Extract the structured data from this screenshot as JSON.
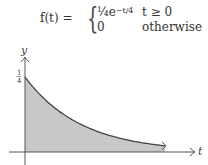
{
  "formula": {
    "lhs": "f(t) =",
    "cases": [
      {
        "expr_base": "¼e",
        "expr_exponent": "−t/4",
        "condition": "t ≥ 0"
      },
      {
        "expr": "0",
        "condition": "otherwise"
      }
    ]
  },
  "chart_data": {
    "type": "area",
    "xlabel": "t",
    "ylabel": "y",
    "y_ticks": [
      {
        "value": 0.25,
        "label": "1/4"
      }
    ],
    "x_ticks": [],
    "function": "0.25*exp(-t/4)",
    "x": [
      0,
      1,
      2,
      3,
      4,
      5,
      6,
      7,
      8,
      9,
      10
    ],
    "values": [
      0.25,
      0.195,
      0.152,
      0.118,
      0.092,
      0.072,
      0.056,
      0.043,
      0.034,
      0.026,
      0.021
    ],
    "xlim": [
      0,
      10
    ],
    "ylim": [
      0,
      0.25
    ],
    "fill": "shaded under curve",
    "grid": false,
    "colors": {
      "fill": "#c8c8c8",
      "curve": "#444444",
      "axis": "#555555"
    }
  },
  "axes": {
    "x_label": "t",
    "y_label": "y",
    "y_tick_label_num": "1",
    "y_tick_label_den": "4"
  }
}
